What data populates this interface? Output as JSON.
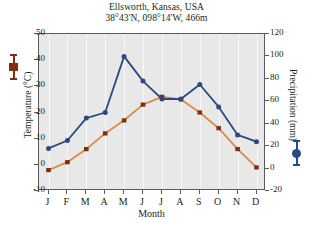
{
  "chart_data": {
    "type": "line",
    "title": "Ellsworth, Kansas, USA",
    "subtitle": "38°43'N, 098°14'W, 466m",
    "xlabel": "Month",
    "ylabel": "Temperature (°C)",
    "y2label": "Precipitation (mm)",
    "categories": [
      "J",
      "F",
      "M",
      "A",
      "M",
      "J",
      "J",
      "A",
      "S",
      "O",
      "N",
      "D"
    ],
    "ylim": [
      -10,
      50
    ],
    "yticks": [
      -10,
      0,
      10,
      20,
      30,
      40,
      50
    ],
    "y2lim": [
      -20,
      120
    ],
    "y2ticks": [
      -20,
      0,
      20,
      40,
      60,
      80,
      100,
      120
    ],
    "grid": "vertical",
    "legend_position": "axis-labels",
    "series": [
      {
        "name": "Temperature (°C)",
        "axis": "left",
        "marker": "square",
        "color": "#7e2f10",
        "line_color": "#d98b4a",
        "values": [
          -2,
          1,
          6,
          12,
          17,
          23,
          26,
          25,
          20,
          14,
          6,
          -1
        ]
      },
      {
        "name": "Precipitation (mm)",
        "axis": "right",
        "marker": "circle",
        "color": "#2c4a80",
        "line_color": "#2c4a80",
        "values": [
          18,
          25,
          45,
          50,
          100,
          78,
          62,
          62,
          75,
          55,
          30,
          24
        ]
      }
    ]
  },
  "colors": {
    "temperature": "#7e2f10",
    "temperature_line": "#d98b4a",
    "precipitation": "#2c4a80",
    "plot_background": "#e8e8e8",
    "axis": "#5a5a5a",
    "text": "#231f20"
  }
}
